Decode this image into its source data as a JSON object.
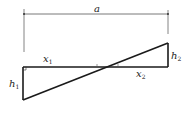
{
  "diagram": {
    "type": "geometry-two-similar-triangles",
    "labels": {
      "width": "a",
      "h1": "h",
      "h1_sub": "1",
      "h2": "h",
      "h2_sub": "2",
      "x1": "x",
      "x1_sub": "1",
      "x2": "x",
      "x2_sub": "2"
    },
    "colors": {
      "stroke": "#1a1a1a",
      "dimension": "#555555",
      "background": "#ffffff"
    }
  }
}
